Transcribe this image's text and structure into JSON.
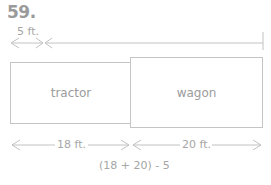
{
  "problem_number": "59.",
  "diagram": {
    "top_dimension": {
      "label": "5 ft."
    },
    "boxes": [
      {
        "label": "tractor"
      },
      {
        "label": "wagon"
      }
    ],
    "bottom_dimensions": [
      {
        "label": "18 ft."
      },
      {
        "label": "20 ft."
      }
    ],
    "expression": "(18 + 20) - 5"
  }
}
